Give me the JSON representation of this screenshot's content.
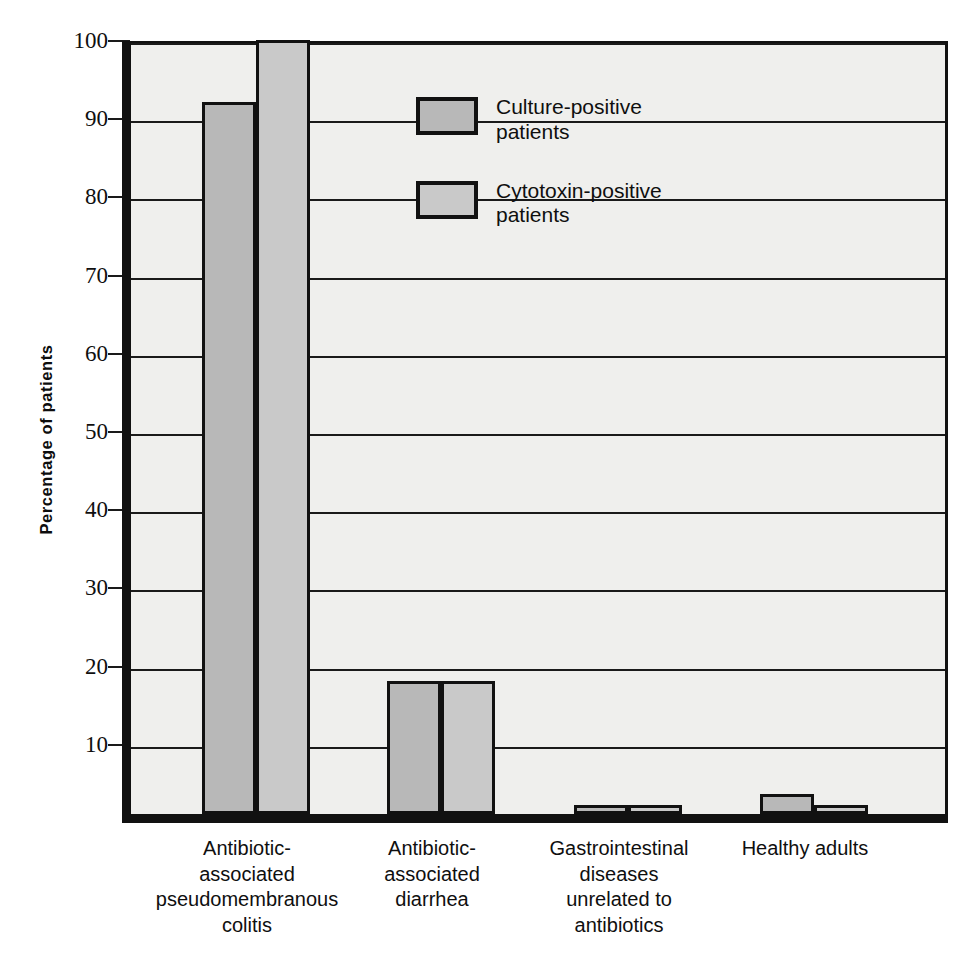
{
  "chart_data": {
    "type": "bar",
    "title": "",
    "xlabel": "",
    "ylabel": "Percentage of patients",
    "ylim": [
      0,
      100
    ],
    "ytick_values": [
      0,
      10,
      20,
      30,
      40,
      50,
      60,
      70,
      80,
      90,
      100
    ],
    "ytick_labels": [
      "",
      "10",
      "20",
      "30",
      "40",
      "50",
      "60",
      "70",
      "80",
      "90",
      "100"
    ],
    "grid": "horizontal",
    "legend_position": "upper-center-right",
    "categories": [
      "Antibiotic-\nassociated\npseudomembranous\ncolitis",
      "Antibiotic-\nassociated\ndiarrhea",
      "Gastrointestinal\ndiseases\nunrelated to\nantibiotics",
      "Healthy adults"
    ],
    "series": [
      {
        "name": "Culture-positive patients",
        "color": "#b8b8b8",
        "values": [
          91,
          17,
          0.5,
          2.5
        ]
      },
      {
        "name": "Cytotoxin-positive patients",
        "color": "#c9c9c9",
        "values": [
          99,
          17,
          1,
          0.5
        ]
      }
    ]
  },
  "axis": {
    "y_title": "Percentage of patients"
  },
  "legend": {
    "entries": [
      {
        "label_line1": "Culture-positive",
        "label_line2": "patients",
        "swatch": "culture-swatch"
      },
      {
        "label_line1": "Cytotoxin-positive",
        "label_line2": "patients",
        "swatch": "cytotoxin-swatch"
      }
    ]
  },
  "x_axis_labels": [
    {
      "lines": [
        "Antibiotic-",
        "associated",
        "pseudomembranous",
        "colitis"
      ]
    },
    {
      "lines": [
        "Antibiotic-",
        "associated",
        "diarrhea"
      ]
    },
    {
      "lines": [
        "Gastrointestinal",
        "diseases",
        "unrelated to",
        "antibiotics"
      ]
    },
    {
      "lines": [
        "Healthy adults"
      ]
    }
  ],
  "colors": {
    "plot_background": "#efefed",
    "axis_line": "#111111",
    "gridline": "#1a1a1a",
    "culture_bar": "#b8b8b8",
    "cytotoxin_bar": "#c9c9c9"
  }
}
